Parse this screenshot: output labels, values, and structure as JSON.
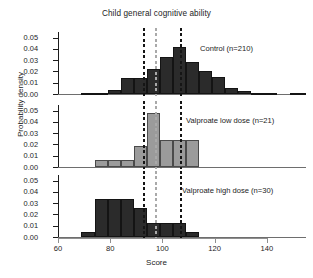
{
  "chart_data": {
    "type": "bar",
    "title": "Child general cognitive ability",
    "xlabel": "Score",
    "ylabel": "Probability density",
    "xlim": [
      60,
      155
    ],
    "ylim": [
      0,
      0.055
    ],
    "xticks": [
      60,
      80,
      100,
      120,
      140
    ],
    "yticks": [
      0.0,
      0.01,
      0.02,
      0.03,
      0.04,
      0.05
    ],
    "ytick_labels": [
      "0.00",
      "0.01",
      "0.02",
      "0.03",
      "0.04",
      "0.05"
    ],
    "grid": false,
    "legend": "none",
    "bin_width": 5,
    "reference_lines": [
      {
        "name": "control-mean-line",
        "x": 93.0,
        "color": "#151515",
        "style": "dashed"
      },
      {
        "name": "low-dose-mean-line",
        "x": 97.5,
        "color": "#a9a9a9",
        "style": "dashed"
      },
      {
        "name": "high-dose-mean-line",
        "x": 107.0,
        "color": "#151515",
        "style": "dashed"
      }
    ],
    "panels": [
      {
        "name": "control",
        "label": "Control (n=210)",
        "color": "#2b2b2b",
        "bins": [
          {
            "x0": 69,
            "x1": 74,
            "density": 0.0008
          },
          {
            "x0": 74,
            "x1": 79,
            "density": 0.0013
          },
          {
            "x0": 79,
            "x1": 84,
            "density": 0.0035
          },
          {
            "x0": 84,
            "x1": 89,
            "density": 0.014
          },
          {
            "x0": 89,
            "x1": 94,
            "density": 0.014
          },
          {
            "x0": 94,
            "x1": 99,
            "density": 0.0222
          },
          {
            "x0": 99,
            "x1": 104,
            "density": 0.033
          },
          {
            "x0": 104,
            "x1": 109,
            "density": 0.0415
          },
          {
            "x0": 109,
            "x1": 114,
            "density": 0.028
          },
          {
            "x0": 114,
            "x1": 119,
            "density": 0.0205
          },
          {
            "x0": 119,
            "x1": 124,
            "density": 0.015
          },
          {
            "x0": 124,
            "x1": 129,
            "density": 0.0055
          },
          {
            "x0": 129,
            "x1": 134,
            "density": 0.003
          },
          {
            "x0": 134,
            "x1": 139,
            "density": 0.0012
          },
          {
            "x0": 139,
            "x1": 144,
            "density": 0.0008
          },
          {
            "x0": 149,
            "x1": 155,
            "density": 0.001
          }
        ]
      },
      {
        "name": "valproate-low-dose",
        "label": "Valproate low dose (n=21)",
        "color": "#9b9b9b",
        "bins": [
          {
            "x0": 74,
            "x1": 79,
            "density": 0.0064
          },
          {
            "x0": 79,
            "x1": 84,
            "density": 0.0064
          },
          {
            "x0": 84,
            "x1": 89,
            "density": 0.0064
          },
          {
            "x0": 89,
            "x1": 94,
            "density": 0.0182
          },
          {
            "x0": 94,
            "x1": 99,
            "density": 0.0482
          },
          {
            "x0": 99,
            "x1": 104,
            "density": 0.024
          },
          {
            "x0": 104,
            "x1": 109,
            "density": 0.024
          },
          {
            "x0": 109,
            "x1": 114,
            "density": 0.024
          }
        ]
      },
      {
        "name": "valproate-high-dose",
        "label": "Valproate high dose (n=30)",
        "color": "#2b2b2b",
        "bins": [
          {
            "x0": 69,
            "x1": 74,
            "density": 0.004
          },
          {
            "x0": 74,
            "x1": 79,
            "density": 0.0335
          },
          {
            "x0": 79,
            "x1": 84,
            "density": 0.0335
          },
          {
            "x0": 84,
            "x1": 89,
            "density": 0.0335
          },
          {
            "x0": 89,
            "x1": 94,
            "density": 0.0255
          },
          {
            "x0": 94,
            "x1": 99,
            "density": 0.0125
          },
          {
            "x0": 99,
            "x1": 104,
            "density": 0.0125
          },
          {
            "x0": 104,
            "x1": 109,
            "density": 0.0125
          },
          {
            "x0": 109,
            "x1": 114,
            "density": 0.004
          }
        ]
      }
    ]
  }
}
